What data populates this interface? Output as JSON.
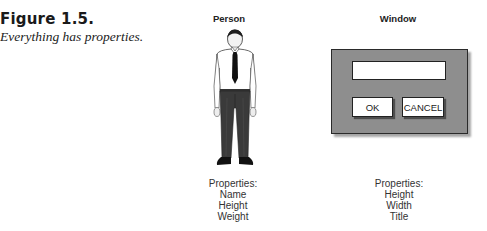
{
  "figure": {
    "label": "Figure 1.5.",
    "caption": "Everything has properties."
  },
  "person": {
    "title": "Person",
    "properties_heading": "Properties:",
    "properties": [
      "Name",
      "Height",
      "Weight"
    ],
    "illustration": "man-in-shirt-and-tie"
  },
  "window": {
    "title": "Window",
    "text_field_value": "",
    "buttons": [
      {
        "label": "OK"
      },
      {
        "label": "CANCEL"
      }
    ],
    "properties_heading": "Properties:",
    "properties": [
      "Height",
      "Width",
      "Title"
    ],
    "colors": {
      "frame": "#8e8e8e",
      "border": "#2a2a2a",
      "control_bg": "#ffffff"
    }
  }
}
